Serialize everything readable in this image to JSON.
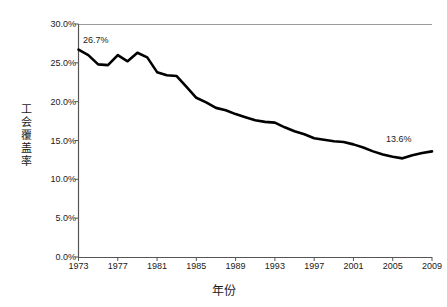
{
  "chart_data": {
    "type": "line",
    "title": "",
    "xlabel": "年份",
    "ylabel": "工会覆盖率",
    "grid": false,
    "legend": "none",
    "xlim": [
      1973,
      2009
    ],
    "ylim": [
      0,
      30
    ],
    "x_tick_labels": [
      "1973",
      "1977",
      "1981",
      "1985",
      "1989",
      "1993",
      "1997",
      "2001",
      "2005",
      "2009"
    ],
    "x_ticks": [
      1973,
      1977,
      1981,
      1985,
      1989,
      1993,
      1997,
      2001,
      2005,
      2009
    ],
    "y_tick_labels": [
      "0.0%",
      "5.0%",
      "10.0%",
      "15.0%",
      "20.0%",
      "25.0%",
      "30.0%"
    ],
    "y_ticks": [
      0,
      5,
      10,
      15,
      20,
      25,
      30
    ],
    "series": [
      {
        "name": "工会覆盖率",
        "color": "#000000",
        "x": [
          1973,
          1974,
          1975,
          1976,
          1977,
          1978,
          1979,
          1980,
          1981,
          1982,
          1983,
          1984,
          1985,
          1986,
          1987,
          1988,
          1989,
          1990,
          1991,
          1992,
          1993,
          1994,
          1995,
          1996,
          1997,
          1998,
          1999,
          2000,
          2001,
          2002,
          2003,
          2004,
          2005,
          2006,
          2007,
          2008,
          2009
        ],
        "values": [
          26.7,
          26.0,
          24.8,
          24.7,
          26.0,
          25.2,
          26.3,
          25.7,
          23.8,
          23.4,
          23.3,
          21.9,
          20.5,
          19.9,
          19.2,
          18.9,
          18.4,
          18.0,
          17.6,
          17.4,
          17.3,
          16.7,
          16.2,
          15.8,
          15.3,
          15.1,
          14.9,
          14.8,
          14.5,
          14.1,
          13.6,
          13.2,
          12.9,
          12.7,
          13.1,
          13.4,
          13.6
        ]
      }
    ],
    "annotations": [
      {
        "label": "26.7%",
        "x": 1973,
        "y": 26.7
      },
      {
        "label": "13.6%",
        "x": 2009,
        "y": 13.6
      }
    ]
  },
  "axis": {
    "y_title_chars": [
      "工",
      "会",
      "覆",
      "盖",
      "率"
    ]
  }
}
